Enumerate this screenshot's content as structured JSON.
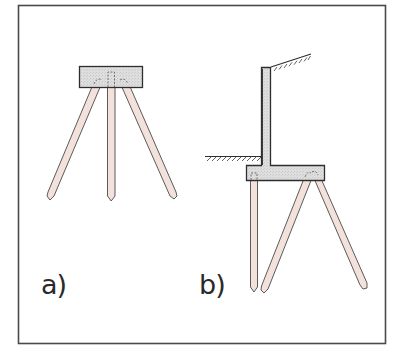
{
  "figure": {
    "panels": [
      {
        "id": "a",
        "label": "a)",
        "description": "Pile cap supported by three piles: one vertical center pile and two raked (battered) piles splaying outward"
      },
      {
        "id": "b",
        "label": "b)",
        "description": "Cantilever retaining wall on a pile-supported footing: one vertical pile under the toe and two raked piles under the heel; retained soil slopes upward behind the wall, ground level in front"
      }
    ],
    "colors": {
      "frame": "#4a4a4a",
      "outline": "#3a3a3a",
      "concrete_fill": "#dcdcdc",
      "pile_fill": "#f3e1dc",
      "soil_hatch": "#3a3a3a",
      "label_text": "#2a2a2a",
      "background": "#ffffff"
    }
  }
}
